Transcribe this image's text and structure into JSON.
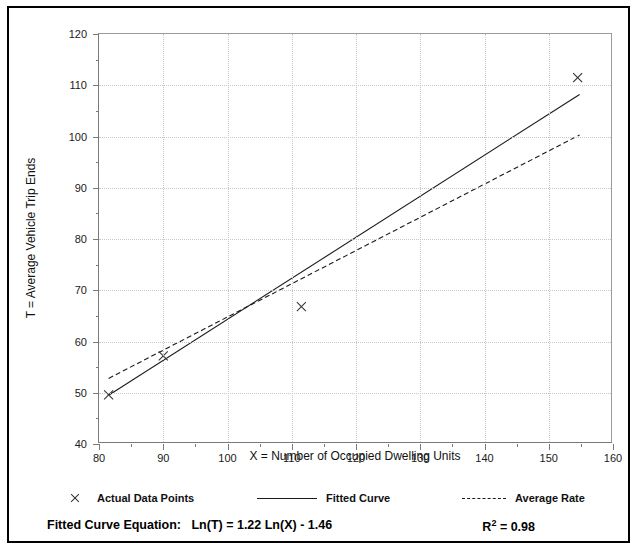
{
  "chart_data": {
    "type": "scatter",
    "title": "",
    "xlabel": "X = Number of Occupied Dwelling Units",
    "ylabel": "T = Average Vehicle Trip Ends",
    "xlim": [
      80,
      160
    ],
    "ylim": [
      40,
      120
    ],
    "xticks": [
      80,
      90,
      100,
      110,
      120,
      130,
      140,
      150,
      160
    ],
    "yticks": [
      40,
      50,
      60,
      70,
      80,
      90,
      100,
      110,
      120
    ],
    "x_minor_step": 5,
    "y_minor_step": 5,
    "grid": "dotted-gray-major",
    "legend_position": "below-axes",
    "points": [
      {
        "x": 81.5,
        "y": 49.6
      },
      {
        "x": 90.0,
        "y": 57.2
      },
      {
        "x": 111.5,
        "y": 66.8
      },
      {
        "x": 154.5,
        "y": 111.5
      }
    ],
    "series": [
      {
        "name": "Fitted Curve",
        "style": "solid",
        "equation": "Ln(T) = 1.22 Ln(X) - 1.46",
        "endpoints": [
          {
            "x": 81.5,
            "y": 49.5
          },
          {
            "x": 154.8,
            "y": 108.2
          }
        ]
      },
      {
        "name": "Average Rate",
        "style": "dashed",
        "endpoints": [
          {
            "x": 81.5,
            "y": 52.8
          },
          {
            "x": 154.8,
            "y": 100.3
          }
        ]
      }
    ],
    "markers": {
      "shape": "x",
      "label": "Actual Data Points"
    }
  },
  "top_text": {
    "left": "",
    "right": ""
  },
  "legend": {
    "items": [
      {
        "label": "Actual Data Points",
        "marker": "x-marker"
      },
      {
        "label": "Fitted Curve",
        "marker": "solid-line"
      },
      {
        "label": "Average Rate",
        "marker": "dashed-line"
      }
    ]
  },
  "footer": {
    "equation_label": "Fitted Curve Equation:",
    "equation": "Ln(T) = 1.22 Ln(X) - 1.46",
    "r2_label": "R",
    "r2_exp": "2",
    "r2_value": "= 0.98"
  },
  "colors": {
    "axis": "#7a7a7a",
    "grid": "#c8c8c8",
    "line": "#1a1a1a",
    "text": "#111111",
    "border": "#000000"
  }
}
